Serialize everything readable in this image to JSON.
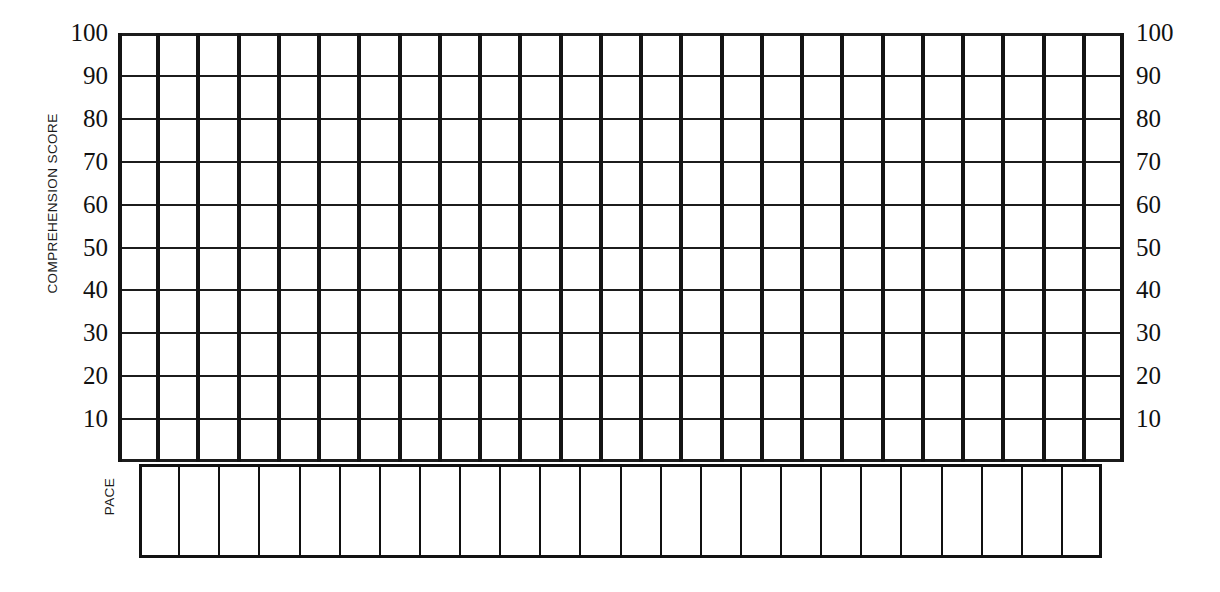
{
  "chart_data": {
    "type": "table",
    "title": "",
    "subtitle": "",
    "ylabel": "COMPREHENSION SCORE",
    "xlabel": "PACE",
    "ylim": [
      0,
      100
    ],
    "ytick_labels_left": [
      "100",
      "90",
      "80",
      "70",
      "60",
      "50",
      "40",
      "30",
      "20",
      "10"
    ],
    "ytick_labels_right": [
      "100",
      "90",
      "80",
      "70",
      "60",
      "50",
      "40",
      "30",
      "20",
      "10"
    ],
    "ytick_values": [
      100,
      90,
      80,
      70,
      60,
      50,
      40,
      30,
      20,
      10
    ],
    "categories": [],
    "values": [],
    "series": [],
    "grid": true,
    "legend": null,
    "annotations": [],
    "grid_columns": 25,
    "grid_rows": 10,
    "pace_columns": 24
  },
  "axes": {
    "left": {
      "title": "COMPREHENSION SCORE",
      "ticks": [
        "100",
        "90",
        "80",
        "70",
        "60",
        "50",
        "40",
        "30",
        "20",
        "10"
      ]
    },
    "right": {
      "ticks": [
        "100",
        "90",
        "80",
        "70",
        "60",
        "50",
        "40",
        "30",
        "20",
        "10"
      ]
    },
    "bottom": {
      "title": "PACE"
    }
  },
  "style": {
    "background": "#ffffff",
    "line_color": "#111111",
    "vertical_line_color": "#141414",
    "horizontal_line_color": "#1c1c1c",
    "text_color": "#111111"
  }
}
